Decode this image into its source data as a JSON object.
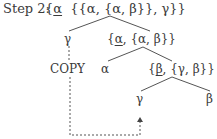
{
  "title": {
    "step_label": "Step 2:",
    "expr_open": "{",
    "expr_head": "α",
    "expr_rest": "  {{α, {α, β}}, γ}}"
  },
  "tree": {
    "root_left_child": "γ",
    "mid_node": {
      "open": "{",
      "head": "α",
      "rest": ", {α, β}}"
    },
    "copy_label": "COPY",
    "alpha_leaf": "α",
    "lower_node": {
      "open": "{",
      "head": "β",
      "rest": ", {γ, β}}"
    },
    "gamma_leaf": "γ",
    "beta_leaf": "β"
  },
  "colors": {
    "ink": "#3a3a3a",
    "line": "#555555"
  }
}
